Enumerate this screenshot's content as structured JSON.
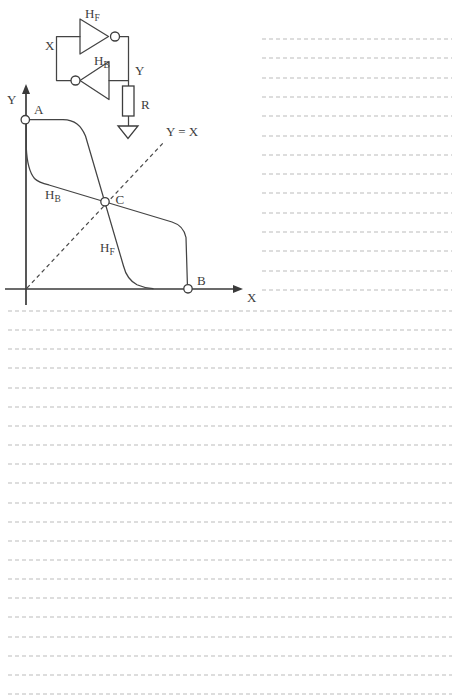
{
  "figure": {
    "circuit": {
      "forward_inverter_label": {
        "main": "H",
        "sub": "F"
      },
      "feedback_inverter_label": {
        "main": "H",
        "sub": "B"
      },
      "node_x_label": "X",
      "node_y_label": "Y",
      "resistor_label": "R"
    },
    "graph": {
      "y_axis_label": "Y",
      "x_axis_label": "X",
      "identity_line_label": "Y = X",
      "point_labels": {
        "a": "A",
        "b": "B",
        "c": "C"
      },
      "forward_curve_label": {
        "main": "H",
        "sub": "F"
      },
      "feedback_curve_label": {
        "main": "H",
        "sub": "B"
      }
    }
  },
  "notebook": {
    "right_column_rules": {
      "count": 14,
      "top": 38,
      "spacing": 19.3,
      "left": 262,
      "width": 190
    },
    "full_width_rules": {
      "count": 21,
      "top": 310,
      "spacing": 19.15,
      "left": 8,
      "width": 444
    }
  },
  "colors": {
    "ink": "#414141",
    "rule": "#d7d7d7",
    "paper": "#ffffff"
  }
}
